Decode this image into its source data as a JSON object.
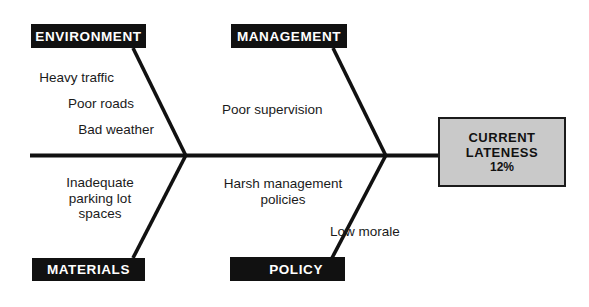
{
  "diagram": {
    "type": "fishbone-ishikawa",
    "colors": {
      "category_box_fill": "#111111",
      "category_box_text": "#ffffff",
      "effect_box_fill": "#c9c9c9",
      "effect_box_border": "#1b1b1b",
      "line": "#111111",
      "text": "#1a1a1a",
      "background": "#ffffff"
    },
    "categories": [
      {
        "id": "environment",
        "label": "ENVIRONMENT",
        "position": "top-left"
      },
      {
        "id": "management",
        "label": "MANAGEMENT",
        "position": "top-right"
      },
      {
        "id": "materials",
        "label": "MATERIALS",
        "position": "bottom-left"
      },
      {
        "id": "policy",
        "label": "POLICY",
        "position": "bottom-right"
      }
    ],
    "causes": {
      "environment": [
        "Heavy traffic",
        "Poor roads",
        "Bad weather"
      ],
      "management": [
        "Poor supervision"
      ],
      "materials": [
        "Inadequate\nparking lot\nspaces"
      ],
      "policy": [
        "Harsh management\npolicies",
        "Low morale"
      ]
    },
    "effect": {
      "line1": "CURRENT",
      "line2": "LATENESS",
      "value": "12%"
    }
  }
}
